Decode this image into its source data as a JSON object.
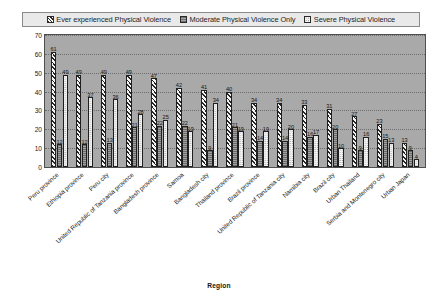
{
  "chart_data": {
    "type": "bar",
    "title": "",
    "xlabel": "Region",
    "ylabel": "Percentage",
    "ylim": [
      0,
      70
    ],
    "yticks": [
      70,
      60,
      50,
      40,
      30,
      20,
      10,
      0
    ],
    "grid": true,
    "legend_position": "top",
    "categories": [
      "Peru province",
      "Ethiopia province",
      "Peru city",
      "United Republic of Tanzania province",
      "Bangladesh province",
      "Samoa",
      "Bangladesh city",
      "Thailand province",
      "Brazil province",
      "United Republic of Tanzania city",
      "Namibia city",
      "Brazil city",
      "Urban Thailand",
      "Serbia and Montenegro city",
      "Urban Japan"
    ],
    "series": [
      {
        "name": "Ever experienced Physical Violence",
        "pattern": "hatch",
        "values": [
          61,
          49,
          49,
          49,
          47,
          42,
          41,
          40,
          34,
          34,
          33,
          31,
          27,
          23,
          13
        ]
      },
      {
        "name": "Moderate Physical Violence Only",
        "pattern": "solid-gray",
        "values": [
          12,
          12,
          13,
          21,
          22,
          22,
          9,
          21,
          14,
          14,
          16,
          20,
          9,
          15,
          9
        ]
      },
      {
        "name": "Severe Physical Violence",
        "pattern": "dotted",
        "values": [
          49,
          37,
          36,
          28,
          25,
          19,
          34,
          19,
          19,
          20,
          17,
          10,
          16,
          13,
          4
        ]
      }
    ]
  },
  "legend": {
    "items": [
      {
        "label": "Ever experienced Physical Violence",
        "swatch": "hatch-swatch-icon"
      },
      {
        "label": "Moderate Physical Violence Only",
        "swatch": "solid-swatch-icon"
      },
      {
        "label": "Severe Physical Violence",
        "swatch": "dotted-swatch-icon"
      }
    ]
  },
  "axes": {
    "y_title": "Percentage",
    "x_title": "Region",
    "y_ticks": [
      "70",
      "60",
      "50",
      "40",
      "30",
      "20",
      "10",
      "0"
    ]
  }
}
